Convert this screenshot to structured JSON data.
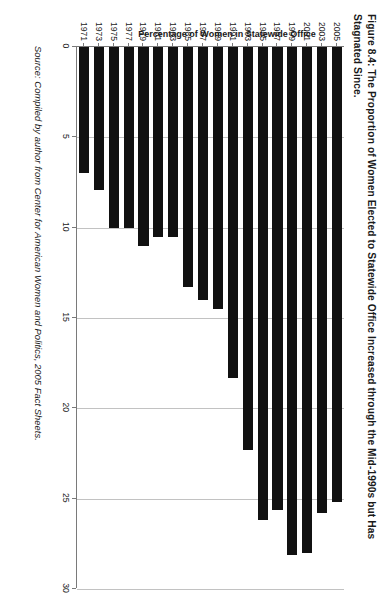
{
  "figure": {
    "title": "Figure 8.4: The Proportion of Women Elected to Statewide Office Increased through the Mid-1990s but Has Stagnated Since.",
    "source": "Source: Compiled by author from Center for American Women and Politics, 2005 Fact Sheets."
  },
  "chart_data": {
    "type": "bar",
    "orientation": "horizontal",
    "title": "Figure 8.4: The Proportion of Women Elected to Statewide Office Increased through the Mid-1990s but Has Stagnated Since.",
    "xlabel": "",
    "ylabel": "Percentage of Women in Statewide Office",
    "categories": [
      "1971",
      "1973",
      "1975",
      "1977",
      "1979",
      "1981",
      "1983",
      "1985",
      "1987",
      "1989",
      "1991",
      "1993",
      "1995",
      "1997",
      "1999",
      "2001",
      "2003",
      "2005"
    ],
    "values": [
      7.0,
      7.9,
      10.0,
      10.0,
      11.0,
      10.5,
      10.5,
      13.3,
      14.0,
      14.5,
      18.3,
      22.3,
      26.2,
      25.6,
      28.1,
      28.0,
      25.8,
      25.2
    ],
    "value_axis": {
      "ticks": [
        0,
        5,
        10,
        15,
        20,
        25,
        30
      ],
      "tick_labels": [
        "0",
        "5",
        "10",
        "15",
        "20",
        "25",
        "30"
      ],
      "min": 0,
      "max": 30
    },
    "grid": true,
    "legend": false,
    "bar_color": "#111111",
    "gridline_color": "#c2c2c2",
    "axis_color": "#7a7a7a"
  }
}
